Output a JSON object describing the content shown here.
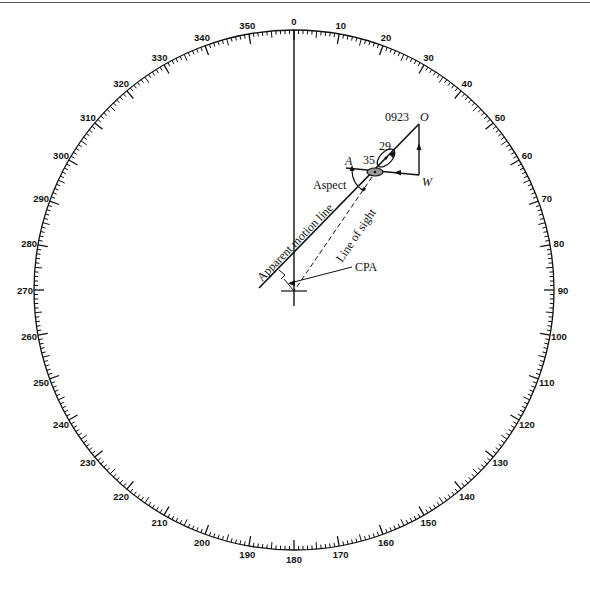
{
  "ring": {
    "center": [
      294,
      290
    ],
    "radius": 260,
    "major_step_deg": 10,
    "medium_step_deg": 5,
    "minor_step_deg": 1,
    "labels": [
      "0",
      "10",
      "20",
      "30",
      "40",
      "50",
      "60",
      "70",
      "80",
      "90",
      "100",
      "110",
      "120",
      "130",
      "140",
      "150",
      "160",
      "170",
      "180",
      "190",
      "200",
      "210",
      "220",
      "230",
      "240",
      "250",
      "260",
      "270",
      "280",
      "290",
      "300",
      "310",
      "320",
      "330",
      "340",
      "350"
    ]
  },
  "diagram": {
    "time_label": "0923",
    "point_o": "O",
    "point_w": "W",
    "point_a": "A",
    "speed_label_29": "29",
    "speed_label_35": "35",
    "aspect_label": "Aspect",
    "apparent_motion_label": "Apparent motion line",
    "line_of_sight_label": "Line of sight",
    "cpa_label": "CPA"
  },
  "colors": {
    "ink": "#111111",
    "ship_fill": "#9a9a9a"
  }
}
